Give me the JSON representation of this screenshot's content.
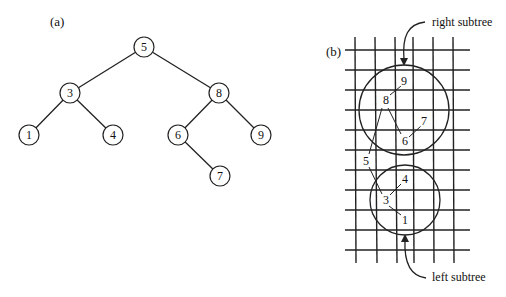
{
  "panel_a": {
    "label": "(a)",
    "nodes": [
      {
        "id": "5",
        "label": "5",
        "x": 144,
        "y": 47
      },
      {
        "id": "3",
        "label": "3",
        "x": 70,
        "y": 93
      },
      {
        "id": "8",
        "label": "8",
        "x": 219,
        "y": 93
      },
      {
        "id": "1",
        "label": "1",
        "x": 29,
        "y": 135
      },
      {
        "id": "4",
        "label": "4",
        "x": 113,
        "y": 135
      },
      {
        "id": "6",
        "label": "6",
        "x": 178,
        "y": 135
      },
      {
        "id": "9",
        "label": "9",
        "x": 261,
        "y": 135
      },
      {
        "id": "7",
        "label": "7",
        "x": 220,
        "y": 176
      }
    ],
    "edges": [
      [
        "5",
        "3"
      ],
      [
        "5",
        "8"
      ],
      [
        "3",
        "1"
      ],
      [
        "3",
        "4"
      ],
      [
        "8",
        "6"
      ],
      [
        "8",
        "9"
      ],
      [
        "6",
        "7"
      ]
    ]
  },
  "panel_b": {
    "label": "(b)",
    "right_subtree_label": "right subtree",
    "left_subtree_label": "left subtree",
    "points": [
      {
        "id": "9",
        "label": "9",
        "x": 404,
        "y": 81
      },
      {
        "id": "8",
        "label": "8",
        "x": 386,
        "y": 100
      },
      {
        "id": "7",
        "label": "7",
        "x": 424,
        "y": 121
      },
      {
        "id": "6",
        "label": "6",
        "x": 405,
        "y": 141
      },
      {
        "id": "5",
        "label": "5",
        "x": 366,
        "y": 161
      },
      {
        "id": "4",
        "label": "4",
        "x": 405,
        "y": 179
      },
      {
        "id": "3",
        "label": "3",
        "x": 386,
        "y": 200
      },
      {
        "id": "1",
        "label": "1",
        "x": 405,
        "y": 220
      }
    ]
  }
}
